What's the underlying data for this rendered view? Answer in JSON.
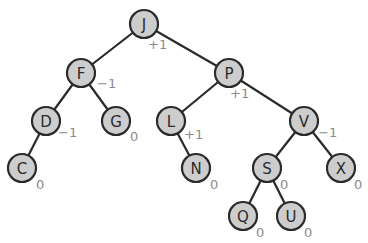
{
  "diagram": {
    "type": "avl-tree",
    "node_radius": 14,
    "colors": {
      "node_fill": "#cdcdcd",
      "node_stroke": "#2a2a2a",
      "edge": "#2a2a2a",
      "balance_text": "#8a8a8a",
      "label_text": "#2a2a2a"
    },
    "nodes": [
      {
        "id": "J",
        "label": "J",
        "x": 144,
        "y": 24,
        "balance": "+1",
        "bx": 148,
        "by": 49
      },
      {
        "id": "F",
        "label": "F",
        "x": 81,
        "y": 73,
        "balance": "−1",
        "bx": 97,
        "by": 88
      },
      {
        "id": "P",
        "label": "P",
        "x": 229,
        "y": 73,
        "balance": "+1",
        "bx": 230,
        "by": 98
      },
      {
        "id": "D",
        "label": "D",
        "x": 46,
        "y": 121,
        "balance": "−1",
        "bx": 58,
        "by": 137
      },
      {
        "id": "G",
        "label": "G",
        "x": 116,
        "y": 121,
        "balance": "0",
        "bx": 130,
        "by": 141
      },
      {
        "id": "L",
        "label": "L",
        "x": 171,
        "y": 121,
        "balance": "+1",
        "bx": 184,
        "by": 139
      },
      {
        "id": "V",
        "label": "V",
        "x": 304,
        "y": 121,
        "balance": "−1",
        "bx": 318,
        "by": 137
      },
      {
        "id": "C",
        "label": "C",
        "x": 22,
        "y": 168,
        "balance": "0",
        "bx": 36,
        "by": 189
      },
      {
        "id": "N",
        "label": "N",
        "x": 196,
        "y": 168,
        "balance": "0",
        "bx": 210,
        "by": 189
      },
      {
        "id": "S",
        "label": "S",
        "x": 267,
        "y": 168,
        "balance": "0",
        "bx": 280,
        "by": 189
      },
      {
        "id": "X",
        "label": "X",
        "x": 341,
        "y": 168,
        "balance": "0",
        "bx": 354,
        "by": 189
      },
      {
        "id": "Q",
        "label": "Q",
        "x": 243,
        "y": 216,
        "balance": "0",
        "bx": 256,
        "by": 237
      },
      {
        "id": "U",
        "label": "U",
        "x": 291,
        "y": 216,
        "balance": "0",
        "bx": 304,
        "by": 237
      }
    ],
    "edges": [
      [
        "J",
        "F"
      ],
      [
        "J",
        "P"
      ],
      [
        "F",
        "D"
      ],
      [
        "F",
        "G"
      ],
      [
        "D",
        "C"
      ],
      [
        "P",
        "L"
      ],
      [
        "P",
        "V"
      ],
      [
        "L",
        "N"
      ],
      [
        "V",
        "S"
      ],
      [
        "V",
        "X"
      ],
      [
        "S",
        "Q"
      ],
      [
        "S",
        "U"
      ]
    ]
  }
}
